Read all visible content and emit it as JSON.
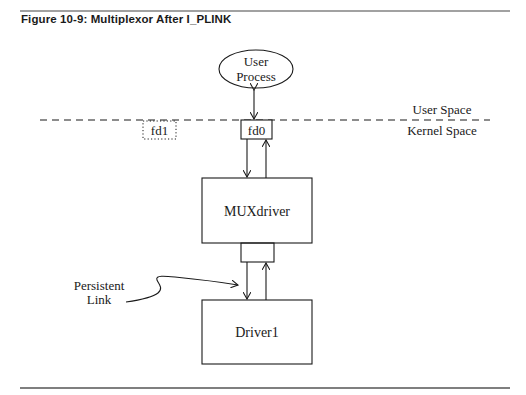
{
  "figure": {
    "caption": "Figure 10-9: Multiplexor After I_PLINK"
  },
  "diagram": {
    "nodes": {
      "user_process": {
        "line1": "User",
        "line2": "Process",
        "shape": "ellipse"
      },
      "fd0": {
        "label": "fd0",
        "shape": "box"
      },
      "fd1": {
        "label": "fd1",
        "shape": "dotted-box"
      },
      "muxdriver": {
        "label": "MUXdriver",
        "shape": "box"
      },
      "link_box": {
        "label": "",
        "shape": "box"
      },
      "driver1": {
        "label": "Driver1",
        "shape": "box"
      }
    },
    "regions": {
      "user_space": "User Space",
      "kernel_space": "Kernel Space"
    },
    "annotation": {
      "line1": "Persistent",
      "line2": "Link"
    },
    "edges": [
      {
        "from": "user_process",
        "to": "fd0",
        "type": "bidirectional"
      },
      {
        "from": "fd0",
        "to": "muxdriver",
        "type": "down"
      },
      {
        "from": "muxdriver",
        "to": "fd0",
        "type": "up"
      },
      {
        "from": "link_box",
        "to": "driver1",
        "type": "down"
      },
      {
        "from": "driver1",
        "to": "link_box",
        "type": "up"
      }
    ],
    "colors": {
      "ink": "#1a1a1a",
      "background": "#ffffff"
    }
  }
}
